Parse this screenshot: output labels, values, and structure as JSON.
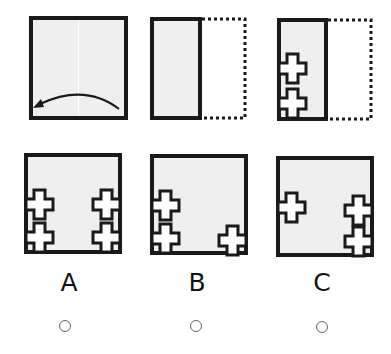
{
  "colors": {
    "stroke": "#1a1a1a",
    "fill": "#efefef",
    "background": "#ffffff",
    "fold_line": "#ffffff",
    "radio_border": "#666666"
  },
  "question": {
    "steps": [
      {
        "id": "step-1",
        "description": "square paper with vertical center crease; curved arrow folds right half onto left half",
        "icon": "curved-arrow-left-icon"
      },
      {
        "id": "step-2",
        "description": "folded paper (left half solid), right half shown as dotted outline"
      },
      {
        "id": "step-3",
        "description": "folded paper with two cross-shaped cutouts on left edge, right half dotted outline"
      }
    ]
  },
  "options": [
    {
      "label": "A",
      "crosses": "two on left edge, two on right edge"
    },
    {
      "label": "B",
      "crosses": "two on left edge, one bottom right"
    },
    {
      "label": "C",
      "crosses": "one on left middle, two on right edge"
    }
  ]
}
